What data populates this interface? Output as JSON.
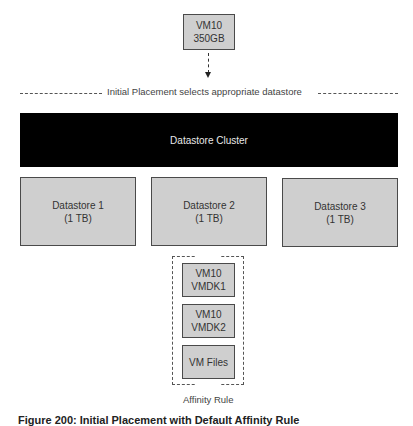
{
  "vm_source": {
    "line1": "VM10",
    "line2": "350GB"
  },
  "placement_label": "Initial Placement selects appropriate datastore",
  "cluster": {
    "label": "Datastore Cluster"
  },
  "datastores": [
    {
      "name": "Datastore 1",
      "size": "(1 TB)"
    },
    {
      "name": "Datastore 2",
      "size": "(1 TB)"
    },
    {
      "name": "Datastore 3",
      "size": "(1 TB)"
    }
  ],
  "affinity_group": {
    "items": [
      {
        "line1": "VM10",
        "line2": "VMDK1"
      },
      {
        "line1": "VM10",
        "line2": "VMDK2"
      },
      {
        "line1": "VM Files",
        "line2": ""
      }
    ],
    "label": "Affinity Rule"
  },
  "caption": "Figure 200: Initial Placement with Default Affinity Rule",
  "colors": {
    "box_fill": "#cfcfcf",
    "cluster_fill": "#000000",
    "border": "#4a4a4a"
  }
}
